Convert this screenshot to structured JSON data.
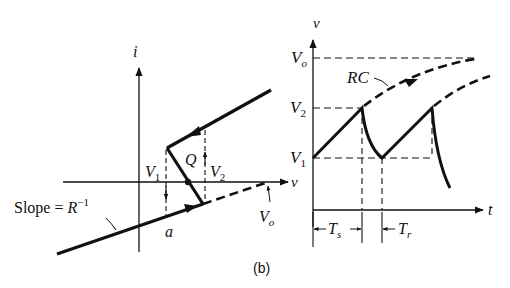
{
  "figure": {
    "caption": "(b)",
    "ink_color": "#111111",
    "background": "#ffffff"
  },
  "left_graph": {
    "title": "i-v characteristic (negative resistance)",
    "y_axis_label": "i",
    "x_axis_label": "v",
    "slope_label_prefix": "Slope = ",
    "slope_label_var": "R",
    "slope_label_exp": "−1",
    "point_label": "Q",
    "point_a_label": "a",
    "v1_label": "V",
    "v1_sub": "1",
    "v2_label": "V",
    "v2_sub": "2",
    "vo_label": "V",
    "vo_sub": "o"
  },
  "right_graph": {
    "title": "Relaxation oscillator voltage waveform",
    "y_axis_label": "v",
    "x_axis_label": "t",
    "levels": [
      {
        "name": "Vo",
        "main": "V",
        "sub": "o"
      },
      {
        "name": "V2",
        "main": "V",
        "sub": "2"
      },
      {
        "name": "V1",
        "main": "V",
        "sub": "1"
      }
    ],
    "rc_label": "RC",
    "ts_label": "T",
    "ts_sub": "s",
    "tr_label": "T",
    "tr_sub": "r"
  }
}
